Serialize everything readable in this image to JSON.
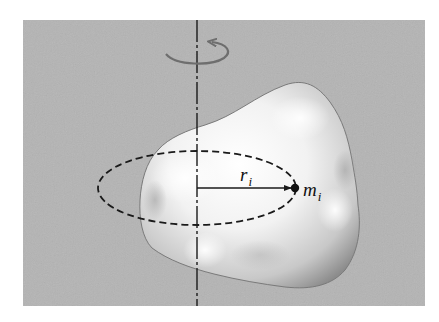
{
  "figure": {
    "labels": {
      "radius_main": "r",
      "radius_sub": "i",
      "mass_main": "m",
      "mass_sub": "i"
    },
    "colors": {
      "background": "#ffffff",
      "panel": "#b4b4b4",
      "body_light": "#ffffff",
      "body_shadow": "#8c8c8c",
      "line": "#1a1a1a",
      "rotation_arrow": "#6e6e6e"
    },
    "elements": {
      "axis": "dash-dot vertical rotation axis",
      "rotation_arrow": "curved arrow indicating rotation",
      "orbit": "dashed ellipse (circular path of m_i in perspective)",
      "radius_vector": "arrow from axis to m_i",
      "mass_point": "filled dot m_i"
    }
  }
}
